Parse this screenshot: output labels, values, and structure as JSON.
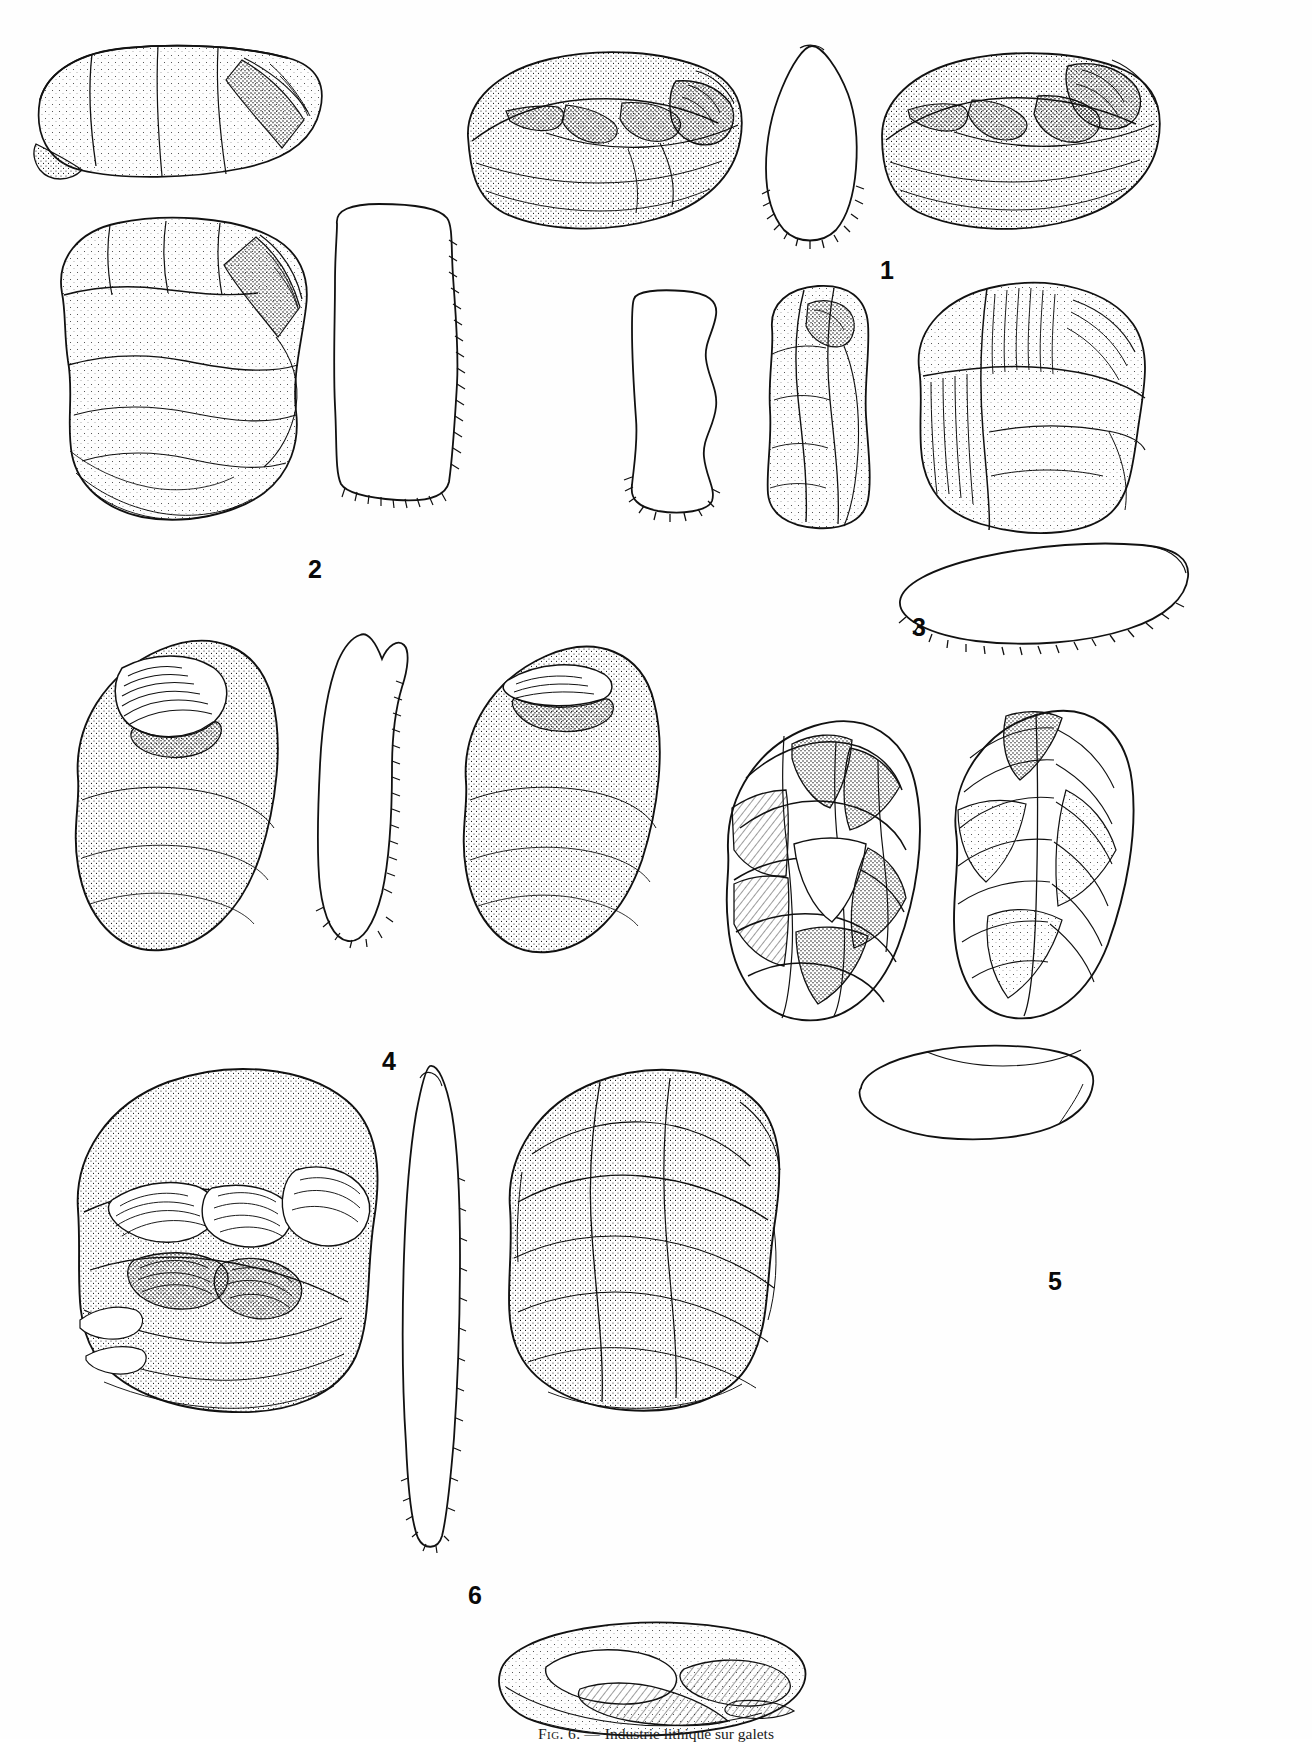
{
  "page": {
    "kind": "figure-plate",
    "width": 1312,
    "height": 1739,
    "background": "#ffffff",
    "ink": "#111111"
  },
  "caption": {
    "figure_label": "Fig. 6.",
    "dash": "—",
    "text": "Industrie lithique sur galets",
    "full": "Fig. 6. — Industrie lithique sur galets",
    "clipped": true
  },
  "items": [
    {
      "id": "1",
      "label": "1",
      "label_x": 880,
      "label_y": 258,
      "views": [
        "dorsal",
        "section",
        "ventral"
      ],
      "description": "chopper sur galet, vues dorsale et ventrale avec coupe denticulee"
    },
    {
      "id": "2",
      "label": "2",
      "label_x": 308,
      "label_y": 557,
      "views": [
        "upper-fragment",
        "main-face",
        "section"
      ],
      "description": "nucleus / galet amenage, face principale et profil"
    },
    {
      "id": "3",
      "label": "3",
      "label_x": 912,
      "label_y": 615,
      "views": [
        "section-left",
        "narrow-face",
        "broad-face",
        "basal-section"
      ],
      "description": "galet amenage allonge, trois vues et coupe"
    },
    {
      "id": "4",
      "label": "4",
      "label_x": 382,
      "label_y": 1049,
      "views": [
        "face-a",
        "section",
        "face-b"
      ],
      "description": "galet ovalaire a enlevement unique, deux faces et coupe"
    },
    {
      "id": "5",
      "label": "5",
      "label_x": 1048,
      "label_y": 1269,
      "views": [
        "face-a",
        "face-b",
        "section"
      ],
      "description": "biface / nucleus discoide, deux faces et coupe"
    },
    {
      "id": "6",
      "label": "6",
      "label_x": 468,
      "label_y": 1583,
      "views": [
        "face-a",
        "section",
        "face-b",
        "basal-view"
      ],
      "description": "chopping-tool sur gros galet, deux faces, coupe et vue basale"
    }
  ],
  "style": {
    "label_font_size_px": 25,
    "label_color": "#0a0a0a",
    "caption_font_size_px": 15.5,
    "line_color": "#111111",
    "stipple_color": "#1a1a1a"
  }
}
